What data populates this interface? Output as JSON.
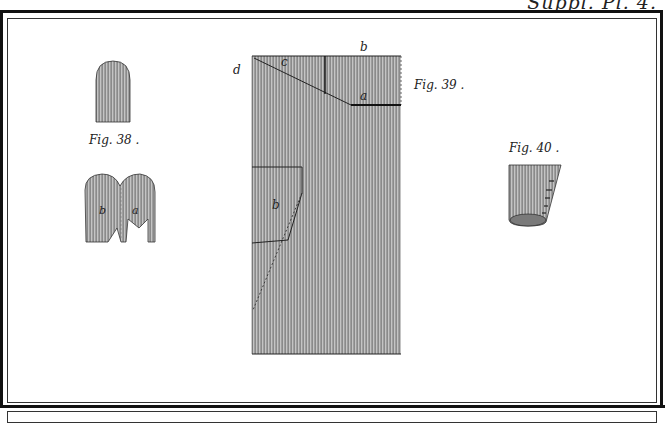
{
  "plate": {
    "header_text": "Suppl. Pl. 4.",
    "colors": {
      "ink": "#222222",
      "hatch_dark": "#8d8d8d",
      "hatch_light": "#c4c4c4",
      "paper": "#ffffff"
    }
  },
  "figures": [
    {
      "id": "fig38",
      "caption": "Fig. 38 .",
      "parts": [
        "b",
        "a"
      ]
    },
    {
      "id": "fig39",
      "caption": "Fig. 39 .",
      "parts": [
        "b",
        "c",
        "d",
        "a",
        "b"
      ]
    },
    {
      "id": "fig40",
      "caption": "Fig. 40 ."
    }
  ],
  "labels": {
    "fig38_b": "b",
    "fig38_a": "a",
    "fig39_top_b": "b",
    "fig39_c": "c",
    "fig39_d": "d",
    "fig39_a": "a",
    "fig39_inner_b": "b"
  }
}
